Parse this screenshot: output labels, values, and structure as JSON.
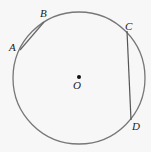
{
  "diagram": {
    "colors": {
      "circle": "#777777",
      "chord": "#555555",
      "label": "#222222",
      "background": "#f7f7f7"
    },
    "circle": {
      "cx": 79,
      "cy": 78,
      "r": 66
    },
    "center": {
      "label": "O",
      "x": 79,
      "y": 77
    },
    "points": [
      {
        "label": "A",
        "x": 20,
        "y": 50
      },
      {
        "label": "B",
        "x": 44,
        "y": 22
      },
      {
        "label": "C",
        "x": 127,
        "y": 31
      },
      {
        "label": "D",
        "x": 131,
        "y": 120
      }
    ],
    "chords": [
      {
        "from": "A",
        "to": "B"
      },
      {
        "from": "C",
        "to": "D"
      }
    ]
  }
}
